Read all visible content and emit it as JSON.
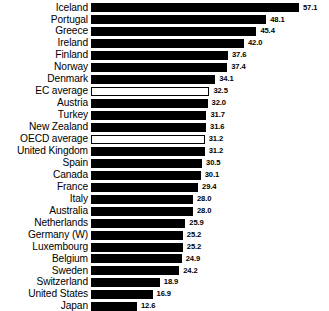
{
  "chart_data": {
    "type": "bar",
    "orientation": "horizontal",
    "title": "",
    "subtitle": "",
    "xlabel": "",
    "ylabel": "",
    "grid": false,
    "legend": "none",
    "xlim": [
      0,
      57.1
    ],
    "value_format": "one-decimal",
    "categories": [
      "Iceland",
      "Portugal",
      "Greece",
      "Ireland",
      "Finland",
      "Norway",
      "Denmark",
      "EC average",
      "Austria",
      "Turkey",
      "New Zealand",
      "OECD average",
      "United Kingdom",
      "Spain",
      "Canada",
      "France",
      "Italy",
      "Australia",
      "Netherlands",
      "Germany (W)",
      "Luxembourg",
      "Belgium",
      "Sweden",
      "Switzerland",
      "United States",
      "Japan"
    ],
    "values": [
      57.1,
      48.1,
      45.4,
      42.0,
      37.6,
      37.4,
      34.1,
      32.5,
      32.0,
      31.7,
      31.6,
      31.2,
      31.2,
      30.5,
      30.1,
      29.4,
      28.0,
      28.0,
      25.9,
      25.2,
      25.2,
      24.9,
      24.2,
      18.9,
      16.9,
      12.6
    ],
    "value_labels": [
      "57.1",
      "48.1",
      "45.4",
      "42.0",
      "37.6",
      "37.4",
      "34.1",
      "32.5",
      "32.0",
      "31.7",
      "31.6",
      "31.2",
      "31.2",
      "30.5",
      "30.1",
      "29.4",
      "28.0",
      "28.0",
      "25.9",
      "25.2",
      "25.2",
      "24.9",
      "24.2",
      "18.9",
      "16.9",
      "12.6"
    ],
    "styles": [
      "filled",
      "filled",
      "filled",
      "filled",
      "filled",
      "filled",
      "filled",
      "hollow",
      "filled",
      "filled",
      "filled",
      "hollow",
      "filled",
      "filled",
      "filled",
      "filled",
      "filled",
      "filled",
      "filled",
      "filled",
      "filled",
      "filled",
      "filled",
      "filled",
      "filled",
      "filled"
    ],
    "colors": {
      "bar_fill": "#000000",
      "bar_outline": "#000000",
      "hollow_fill": "#ffffff",
      "background": "#ffffff",
      "text": "#000000"
    }
  }
}
